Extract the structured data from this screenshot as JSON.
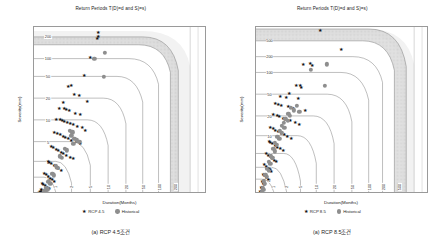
{
  "figure": {
    "panels": [
      {
        "id": "panel-a",
        "title": "Return Periods T(D)=d and S)=s)",
        "caption": "(a) RCP 4.5조건",
        "legend": [
          {
            "marker": "star-marker",
            "label": "RCP 4.5",
            "color": "#111111"
          },
          {
            "marker": "circle-marker",
            "label": "Historical",
            "color": "#8e8e8e"
          }
        ]
      },
      {
        "id": "panel-b",
        "title": "Return Periods T(D)=d and S)=s)",
        "caption": "(a) RCP 8.5조건",
        "legend": [
          {
            "marker": "star-marker",
            "label": "RCP 8.5",
            "color": "#111111"
          },
          {
            "marker": "circle-marker",
            "label": "Historical",
            "color": "#8e8e8e"
          }
        ]
      }
    ]
  },
  "chart_data": [
    {
      "type": "scatter",
      "title": "Return Periods T(D)=d and S)=s)",
      "caption": "(a) RCP 4.5조건",
      "xlabel": "Duration(Months)",
      "ylabel": "Severity(mm)",
      "xlim": [
        0,
        37
      ],
      "ylim": [
        0,
        790
      ],
      "xticks": [
        0,
        5,
        10,
        15,
        20,
        25,
        30,
        35
      ],
      "yticks": [
        0,
        100,
        200,
        300,
        400,
        500,
        600,
        700
      ],
      "grid": false,
      "legend_position": "bottom",
      "contour_levels": [
        1,
        2,
        5,
        10,
        20,
        50,
        100,
        200
      ],
      "contour_labels_left": [
        "200",
        "100",
        "50",
        "20",
        "10",
        "5",
        "2",
        "1"
      ],
      "contour_labels_bottom": [
        "1",
        "2",
        "5",
        "10",
        "20",
        "50",
        "100",
        "200"
      ],
      "shaded_band_level": "200",
      "series": [
        {
          "name": "RCP 4.5",
          "marker": "star",
          "color": "#111111",
          "points": [
            [
              13.6,
              760
            ],
            [
              13.6,
              745
            ],
            [
              13.4,
              735
            ],
            [
              12.0,
              645
            ],
            [
              10.6,
              560
            ],
            [
              7.2,
              508
            ],
            [
              7.9,
              512
            ],
            [
              8.5,
              468
            ],
            [
              9.6,
              462
            ],
            [
              11.4,
              437
            ],
            [
              6.3,
              432
            ],
            [
              5.4,
              403
            ],
            [
              6.5,
              400
            ],
            [
              6.8,
              398
            ],
            [
              7.4,
              392
            ],
            [
              8.8,
              378
            ],
            [
              9.9,
              372
            ],
            [
              4.8,
              352
            ],
            [
              5.6,
              348
            ],
            [
              6.0,
              345
            ],
            [
              6.4,
              340
            ],
            [
              7.0,
              336
            ],
            [
              7.7,
              330
            ],
            [
              8.3,
              326
            ],
            [
              9.1,
              318
            ],
            [
              10.2,
              310
            ],
            [
              11.0,
              300
            ],
            [
              4.2,
              288
            ],
            [
              4.9,
              282
            ],
            [
              5.5,
              278
            ],
            [
              6.1,
              272
            ],
            [
              6.7,
              266
            ],
            [
              7.3,
              258
            ],
            [
              8.0,
              250
            ],
            [
              8.9,
              244
            ],
            [
              9.8,
              236
            ],
            [
              3.6,
              222
            ],
            [
              4.1,
              216
            ],
            [
              4.6,
              210
            ],
            [
              5.1,
              204
            ],
            [
              5.7,
              196
            ],
            [
              6.2,
              188
            ],
            [
              6.9,
              180
            ],
            [
              7.6,
              172
            ],
            [
              8.4,
              164
            ],
            [
              2.9,
              152
            ],
            [
              3.3,
              146
            ],
            [
              3.7,
              140
            ],
            [
              4.2,
              132
            ],
            [
              4.7,
              124
            ],
            [
              5.2,
              116
            ],
            [
              5.8,
              108
            ],
            [
              2.2,
              96
            ],
            [
              2.6,
              88
            ],
            [
              3.0,
              80
            ],
            [
              3.4,
              72
            ],
            [
              3.8,
              64
            ],
            [
              4.3,
              56
            ],
            [
              1.7,
              48
            ],
            [
              2.0,
              42
            ],
            [
              2.4,
              36
            ],
            [
              2.8,
              30
            ],
            [
              3.2,
              24
            ],
            [
              1.4,
              20
            ],
            [
              1.8,
              16
            ],
            [
              2.2,
              12
            ],
            [
              1.2,
              9
            ],
            [
              1.5,
              7
            ],
            [
              1.9,
              5
            ],
            [
              1.1,
              3
            ]
          ]
        },
        {
          "name": "Historical",
          "marker": "circle",
          "color": "#8e8e8e",
          "points": [
            [
              15.2,
              668
            ],
            [
              12.9,
              640
            ],
            [
              14.9,
              555
            ],
            [
              7.6,
              300
            ],
            [
              8.2,
              292
            ],
            [
              8.0,
              276
            ],
            [
              8.6,
              262
            ],
            [
              9.1,
              254
            ],
            [
              9.7,
              248
            ],
            [
              8.4,
              236
            ],
            [
              6.6,
              214
            ],
            [
              7.1,
              206
            ],
            [
              5.6,
              178
            ],
            [
              6.0,
              170
            ],
            [
              4.6,
              132
            ],
            [
              5.0,
              124
            ],
            [
              3.9,
              96
            ],
            [
              4.3,
              88
            ],
            [
              3.1,
              56
            ],
            [
              3.5,
              48
            ],
            [
              2.6,
              30
            ],
            [
              2.9,
              22
            ],
            [
              2.2,
              14
            ],
            [
              2.5,
              8
            ]
          ]
        }
      ]
    },
    {
      "type": "scatter",
      "title": "Return Periods T(D)=d and S)=s)",
      "caption": "(a) RCP 8.5조건",
      "xlabel": "Duration(Months)",
      "ylabel": "Severity(mm)",
      "xlim": [
        0,
        37
      ],
      "ylim": [
        0,
        930
      ],
      "xticks": [
        0,
        5,
        10,
        15,
        20,
        25,
        30,
        35
      ],
      "yticks": [
        0,
        100,
        200,
        300,
        400,
        500,
        600,
        700,
        800,
        900
      ],
      "grid": false,
      "legend_position": "bottom",
      "contour_levels": [
        1,
        2,
        3,
        5,
        10,
        20,
        50,
        100,
        200,
        500
      ],
      "contour_labels_left": [
        "500",
        "200",
        "100",
        "50",
        "20",
        "10",
        "5",
        "3",
        "2",
        "1"
      ],
      "contour_labels_bottom": [
        "1",
        "2",
        "5",
        "10",
        "20",
        "50",
        "100",
        "200",
        "500"
      ],
      "shaded_band_level": "500",
      "series": [
        {
          "name": "RCP 8.5",
          "marker": "star",
          "color": "#111111",
          "points": [
            [
              13.9,
              905
            ],
            [
              18.2,
              800
            ],
            [
              10.2,
              718
            ],
            [
              11.6,
              726
            ],
            [
              12.1,
              712
            ],
            [
              8.6,
              604
            ],
            [
              9.6,
              600
            ],
            [
              9.8,
              588
            ],
            [
              7.2,
              558
            ],
            [
              5.3,
              540
            ],
            [
              6.6,
              532
            ],
            [
              9.1,
              528
            ],
            [
              4.2,
              500
            ],
            [
              4.9,
              496
            ],
            [
              5.5,
              490
            ],
            [
              6.9,
              484
            ],
            [
              8.0,
              472
            ],
            [
              10.6,
              462
            ],
            [
              3.8,
              440
            ],
            [
              4.5,
              434
            ],
            [
              5.1,
              428
            ],
            [
              5.9,
              420
            ],
            [
              6.4,
              412
            ],
            [
              7.3,
              404
            ],
            [
              8.4,
              396
            ],
            [
              9.3,
              386
            ],
            [
              3.2,
              368
            ],
            [
              3.7,
              360
            ],
            [
              4.2,
              352
            ],
            [
              4.8,
              344
            ],
            [
              5.4,
              336
            ],
            [
              6.0,
              328
            ],
            [
              6.8,
              318
            ],
            [
              7.6,
              308
            ],
            [
              2.8,
              292
            ],
            [
              3.2,
              284
            ],
            [
              3.6,
              276
            ],
            [
              4.1,
              268
            ],
            [
              4.6,
              258
            ],
            [
              5.2,
              248
            ],
            [
              5.8,
              238
            ],
            [
              2.3,
              222
            ],
            [
              2.7,
              214
            ],
            [
              3.1,
              206
            ],
            [
              3.5,
              196
            ],
            [
              3.9,
              186
            ],
            [
              4.4,
              176
            ],
            [
              1.9,
              160
            ],
            [
              2.2,
              152
            ],
            [
              2.6,
              142
            ],
            [
              3.0,
              132
            ],
            [
              3.4,
              122
            ],
            [
              1.6,
              108
            ],
            [
              1.9,
              100
            ],
            [
              2.2,
              90
            ],
            [
              2.6,
              80
            ],
            [
              1.3,
              66
            ],
            [
              1.6,
              58
            ],
            [
              1.9,
              48
            ],
            [
              1.1,
              36
            ],
            [
              1.4,
              28
            ],
            [
              1.7,
              20
            ],
            [
              1.0,
              12
            ],
            [
              1.3,
              6
            ]
          ]
        },
        {
          "name": "Historical",
          "marker": "circle",
          "color": "#8e8e8e",
          "points": [
            [
              15.2,
              722
            ],
            [
              11.9,
              690
            ],
            [
              14.8,
              604
            ],
            [
              8.9,
              492
            ],
            [
              7.6,
              478
            ],
            [
              8.2,
              466
            ],
            [
              9.4,
              456
            ],
            [
              7.0,
              448
            ],
            [
              7.4,
              436
            ],
            [
              6.4,
              420
            ],
            [
              6.9,
              408
            ],
            [
              6.1,
              396
            ],
            [
              5.6,
              378
            ],
            [
              6.2,
              368
            ],
            [
              5.2,
              352
            ],
            [
              5.7,
              340
            ],
            [
              4.7,
              318
            ],
            [
              5.1,
              306
            ],
            [
              4.2,
              284
            ],
            [
              4.6,
              272
            ],
            [
              3.8,
              250
            ],
            [
              4.1,
              238
            ],
            [
              3.3,
              214
            ],
            [
              3.6,
              202
            ],
            [
              2.9,
              178
            ],
            [
              3.2,
              166
            ],
            [
              2.5,
              142
            ],
            [
              2.8,
              130
            ],
            [
              2.1,
              106
            ],
            [
              2.4,
              94
            ],
            [
              1.8,
              70
            ],
            [
              2.0,
              58
            ],
            [
              1.5,
              36
            ],
            [
              1.7,
              24
            ],
            [
              1.3,
              12
            ]
          ]
        }
      ]
    }
  ]
}
